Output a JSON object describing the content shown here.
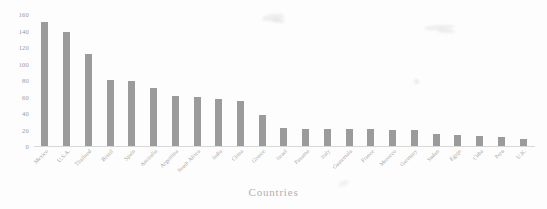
{
  "chart_data": {
    "type": "bar",
    "title": "",
    "subtitle": "",
    "xlabel": "Countries",
    "ylabel": "",
    "ylim": [
      0,
      160
    ],
    "y_ticks": [
      0,
      20,
      40,
      60,
      80,
      100,
      120,
      140,
      160
    ],
    "grid": false,
    "legend": false,
    "bar_color": "#8d8d8d",
    "categories": [
      "Mexico",
      "U.S.A.",
      "Thailand",
      "Brazil",
      "Spain",
      "Australia",
      "Argentina",
      "South Africa",
      "India",
      "China",
      "Greece",
      "Israel",
      "Panama",
      "Italy",
      "Guatemala",
      "France",
      "Morocco",
      "Germany",
      "Sudan",
      "Egypt",
      "Cuba",
      "Peru",
      "U.K."
    ],
    "values": [
      150,
      138,
      112,
      80,
      79,
      70,
      61,
      59,
      57,
      55,
      38,
      22,
      21,
      21,
      21,
      21,
      20,
      20,
      14,
      13,
      12,
      11,
      8
    ]
  },
  "axis": {
    "x_title": "Countries"
  }
}
